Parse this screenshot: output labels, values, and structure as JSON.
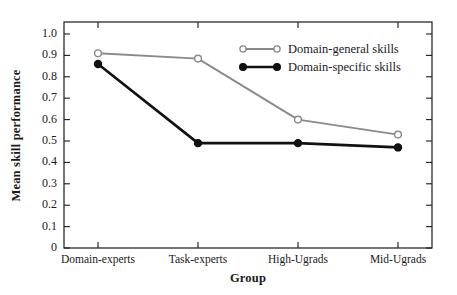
{
  "chart_data": {
    "type": "line",
    "title": "",
    "xlabel": "Group",
    "ylabel": "Mean skill performance",
    "categories": [
      "Domain-experts",
      "Task-experts",
      "High-Ugrads",
      "Mid-Ugrads"
    ],
    "ylim": [
      0,
      1.0
    ],
    "ytick_labels": [
      "1.0",
      "0.9",
      "0.8",
      "0.7",
      "0.6",
      "0.5",
      "0.4",
      "0.3",
      "0.2",
      "0.1",
      "0"
    ],
    "ytick_values": [
      1.0,
      0.9,
      0.8,
      0.7,
      0.6,
      0.5,
      0.4,
      0.3,
      0.2,
      0.1,
      0
    ],
    "grid": false,
    "legend_position": "upper right",
    "series": [
      {
        "name": "Domain-general skills",
        "values": [
          0.91,
          0.885,
          0.6,
          0.53
        ],
        "color": "#8a8a8a",
        "marker": "open-circle"
      },
      {
        "name": "Domain-specific skills",
        "values": [
          0.86,
          0.49,
          0.49,
          0.47
        ],
        "color": "#111111",
        "marker": "filled-circle"
      }
    ]
  },
  "legend": {
    "items": [
      {
        "label": "Domain-general skills"
      },
      {
        "label": "Domain-specific skills"
      }
    ]
  },
  "axes": {
    "y_title": "Mean skill performance",
    "x_title": "Group"
  }
}
